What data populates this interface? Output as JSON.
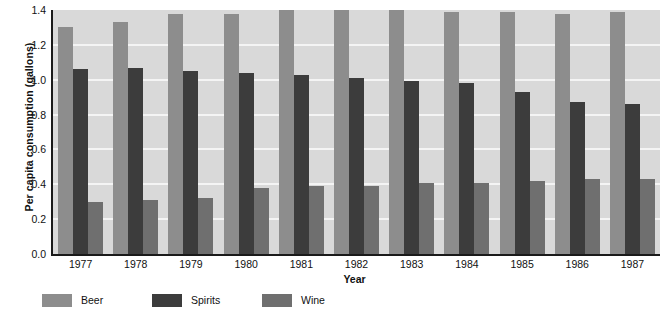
{
  "chart_data": {
    "type": "bar",
    "title": "",
    "subtitle": "",
    "xlabel": "Year",
    "ylabel": "Per capita consumption (gallons)",
    "categories": [
      "1977",
      "1978",
      "1979",
      "1980",
      "1981",
      "1982",
      "1983",
      "1984",
      "1985",
      "1986",
      "1987"
    ],
    "series": [
      {
        "name": "Beer",
        "color": "#8d8d8d",
        "values": [
          1.3,
          1.33,
          1.38,
          1.38,
          1.4,
          1.4,
          1.4,
          1.39,
          1.39,
          1.38,
          1.39
        ]
      },
      {
        "name": "Spirits",
        "color": "#3c3c3c",
        "values": [
          1.06,
          1.07,
          1.05,
          1.04,
          1.03,
          1.01,
          0.99,
          0.98,
          0.93,
          0.87,
          0.86
        ]
      },
      {
        "name": "Wine",
        "color": "#6f6f6f",
        "values": [
          0.3,
          0.31,
          0.32,
          0.38,
          0.39,
          0.39,
          0.41,
          0.41,
          0.42,
          0.43,
          0.43
        ]
      }
    ],
    "ylim": [
      0.0,
      1.4
    ],
    "ytick_step": 0.2,
    "yticks": [
      "1.4",
      "1.2",
      "1.0",
      "0.8",
      "0.6",
      "0.4",
      "0.2",
      "0.0"
    ],
    "grid": true,
    "grid_color": "#f4f4f4",
    "plot_background": "#d9d9d9",
    "legend_position": "bottom-left",
    "legend": [
      "Beer",
      "Spirits",
      "Wine"
    ]
  }
}
